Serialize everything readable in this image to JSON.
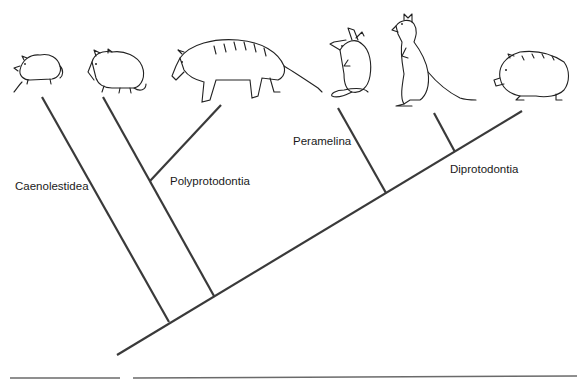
{
  "diagram": {
    "type": "cladogram",
    "line_color": "#3a3a3a",
    "background": "#ffffff",
    "taxa_illustrations": [
      {
        "id": "shrew-opossum",
        "depicts": "shrew opossum (rodent-like marsupial)"
      },
      {
        "id": "opossum",
        "depicts": "opossum"
      },
      {
        "id": "thylacine",
        "depicts": "thylacine (striped wolf-like marsupial)"
      },
      {
        "id": "bandicoot",
        "depicts": "bandicoot / bilby"
      },
      {
        "id": "kangaroo",
        "depicts": "kangaroo"
      },
      {
        "id": "wombat",
        "depicts": "wombat"
      }
    ],
    "clade_labels": {
      "caenolestidea": "Caenolestidea",
      "polyprotodontia": "Polyprotodontia",
      "peramelina": "Peramelina",
      "diprotodontia": "Diprotodontia"
    },
    "branches": [
      {
        "name": "main-stem",
        "x1": 117,
        "y1": 355,
        "x2": 522,
        "y2": 111
      },
      {
        "name": "caenolestidea-branch",
        "x1": 42,
        "y1": 97,
        "x2": 169,
        "y2": 322
      },
      {
        "name": "polyprotodontia-branch",
        "x1": 103,
        "y1": 97,
        "x2": 214,
        "y2": 296
      },
      {
        "name": "thylacine-branch",
        "x1": 150,
        "y1": 181,
        "x2": 221,
        "y2": 105
      },
      {
        "name": "peramelina-branch",
        "x1": 338,
        "y1": 108,
        "x2": 386,
        "y2": 193
      },
      {
        "name": "kangaroo-branch",
        "x1": 434,
        "y1": 113,
        "x2": 455,
        "y2": 152
      }
    ]
  }
}
